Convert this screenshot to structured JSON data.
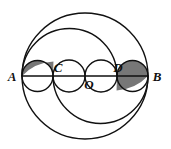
{
  "figure": {
    "background": "#ffffff",
    "stroke_color": "#111111",
    "shade_color": "#777777",
    "stroke_width": 1.4,
    "labels": [
      {
        "name": "point-label-A",
        "text": "A",
        "x": 13,
        "y": 80
      },
      {
        "name": "point-label-C",
        "text": "C",
        "x": 56,
        "y": 73
      },
      {
        "name": "point-label-O",
        "text": "O",
        "x": 87,
        "y": 88
      },
      {
        "name": "point-label-D",
        "text": "D",
        "x": 116,
        "y": 73
      },
      {
        "name": "point-label-B",
        "text": "B",
        "x": 152,
        "y": 80
      }
    ],
    "points": {
      "A": {
        "x": 22,
        "y": 76
      },
      "C": {
        "x": 53,
        "y": 76
      },
      "O": {
        "x": 85,
        "y": 76
      },
      "D": {
        "x": 117,
        "y": 76
      },
      "B": {
        "x": 148,
        "y": 76
      }
    },
    "diameter_line": {
      "name": "diameter-AB",
      "x1": 22,
      "y1": 76,
      "x2": 148,
      "y2": 76
    },
    "circles": [
      {
        "name": "circle-AB-outer",
        "cx": 85,
        "cy": 76,
        "r": 63
      }
    ],
    "arcs": [
      {
        "name": "semicircle-AD-upper",
        "cx": 69.5,
        "cy": 76,
        "r": 47.5,
        "side": "upper"
      },
      {
        "name": "semicircle-CB-lower",
        "cx": 100.5,
        "cy": 76,
        "r": 47.5,
        "side": "lower"
      },
      {
        "name": "semicircle-AC-upper",
        "cx": 37.5,
        "cy": 76,
        "r": 15.5,
        "side": "upper"
      },
      {
        "name": "semicircle-AC-lower",
        "cx": 37.5,
        "cy": 76,
        "r": 15.5,
        "side": "lower"
      },
      {
        "name": "semicircle-CO-upper",
        "cx": 69,
        "cy": 76,
        "r": 16,
        "side": "upper"
      },
      {
        "name": "semicircle-CO-lower",
        "cx": 69,
        "cy": 76,
        "r": 16,
        "side": "lower"
      },
      {
        "name": "semicircle-OD-upper",
        "cx": 101,
        "cy": 76,
        "r": 16,
        "side": "upper"
      },
      {
        "name": "semicircle-OD-lower",
        "cx": 101,
        "cy": 76,
        "r": 16,
        "side": "lower"
      },
      {
        "name": "semicircle-DB-upper",
        "cx": 132.5,
        "cy": 76,
        "r": 15.5,
        "side": "upper"
      },
      {
        "name": "semicircle-DB-lower",
        "cx": 132.5,
        "cy": 76,
        "r": 15.5,
        "side": "lower"
      }
    ],
    "shaded_regions": [
      {
        "name": "shaded-lune-left",
        "description": "region above AC between semicircle AD and semicircle AC"
      },
      {
        "name": "shaded-lune-right",
        "description": "region below DB between semicircle CB and semicircle DB"
      }
    ]
  }
}
